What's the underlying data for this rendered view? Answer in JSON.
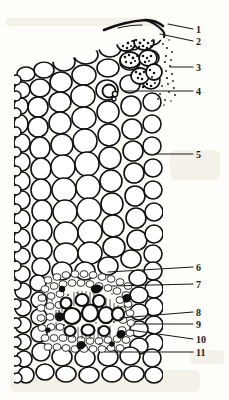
{
  "figure": {
    "type": "scientific-line-drawing",
    "style": "black ink line drawing on off-white scanned paper",
    "colors": {
      "ink": "#101010",
      "paper": "#fdfdfa",
      "stipple": "#1a1a1a",
      "leader_line": "#1a1a1a",
      "scan_artifact": "#d9cfa8"
    },
    "canvas": {
      "width": 229,
      "height": 400
    }
  },
  "labels": [
    {
      "id": "1",
      "text": "1",
      "x": 196,
      "y": 25,
      "leader": {
        "x1": 193,
        "y1": 29,
        "x2": 168,
        "y2": 24
      }
    },
    {
      "id": "2",
      "text": "2",
      "x": 196,
      "y": 37,
      "leader": {
        "x1": 193,
        "y1": 41,
        "x2": 160,
        "y2": 34
      }
    },
    {
      "id": "3",
      "text": "3",
      "x": 196,
      "y": 63,
      "leader": {
        "x1": 193,
        "y1": 67,
        "x2": 170,
        "y2": 67
      }
    },
    {
      "id": "4",
      "text": "4",
      "x": 196,
      "y": 87,
      "leader": {
        "x1": 193,
        "y1": 91,
        "x2": 124,
        "y2": 91
      }
    },
    {
      "id": "5",
      "text": "5",
      "x": 196,
      "y": 150,
      "leader": {
        "x1": 193,
        "y1": 154,
        "x2": 155,
        "y2": 154
      }
    },
    {
      "id": "6",
      "text": "6",
      "x": 196,
      "y": 263,
      "leader": {
        "x1": 193,
        "y1": 267,
        "x2": 108,
        "y2": 272
      }
    },
    {
      "id": "7",
      "text": "7",
      "x": 196,
      "y": 280,
      "leader": {
        "x1": 193,
        "y1": 284,
        "x2": 112,
        "y2": 286
      }
    },
    {
      "id": "8",
      "text": "8",
      "x": 196,
      "y": 308,
      "leader": {
        "x1": 193,
        "y1": 312,
        "x2": 120,
        "y2": 318
      }
    },
    {
      "id": "9",
      "text": "9",
      "x": 196,
      "y": 320,
      "leader": {
        "x1": 193,
        "y1": 324,
        "x2": 133,
        "y2": 324
      }
    },
    {
      "id": "10",
      "text": "10",
      "x": 196,
      "y": 335,
      "leader": {
        "x1": 193,
        "y1": 339,
        "x2": 130,
        "y2": 330
      }
    },
    {
      "id": "11",
      "text": "11",
      "x": 196,
      "y": 348,
      "leader": {
        "x1": 193,
        "y1": 352,
        "x2": 105,
        "y2": 352
      }
    }
  ],
  "regions": [
    {
      "name": "epidermis",
      "note": "thin dark cuticle strip along the upper-right sloping margin"
    },
    {
      "name": "granular-cell-group",
      "note": "dark stippled / granular cells just beneath the upper right epidermis"
    },
    {
      "name": "stippled-zone",
      "note": "loose stipple dots right of the granular group"
    },
    {
      "name": "oil-cell",
      "note": "small round inclusion within cortical parenchyma"
    },
    {
      "name": "cortical-parenchyma",
      "note": "large rounded thin-walled cells filling the middle of the field"
    },
    {
      "name": "bundle-sheath",
      "note": "ring of small dense cells surrounding the vascular bundle"
    },
    {
      "name": "phloem",
      "note": "fine-celled tissue at the periphery of the bundle"
    },
    {
      "name": "xylem-vessels",
      "note": "several large open vessel lumina inside the bundle"
    },
    {
      "name": "sclerenchyma",
      "note": "thick dark walled fibre caps within the bundle"
    }
  ]
}
